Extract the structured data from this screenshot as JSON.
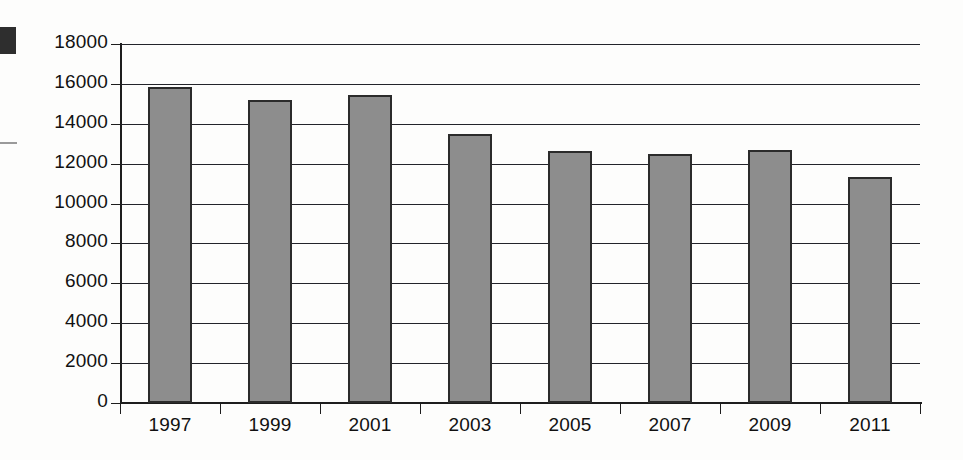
{
  "chart_data": {
    "type": "bar",
    "title": "",
    "subtitle": "",
    "xlabel": "",
    "ylabel": "",
    "categories": [
      "1997",
      "1999",
      "2001",
      "2003",
      "2005",
      "2007",
      "2009",
      "2011"
    ],
    "values": [
      15850,
      15200,
      15450,
      13500,
      12650,
      12500,
      12700,
      11350
    ],
    "ylim": [
      0,
      18000
    ],
    "ytick_labels": [
      "0",
      "2000",
      "4000",
      "6000",
      "8000",
      "10000",
      "12000",
      "14000",
      "16000",
      "18000"
    ],
    "ytick_values": [
      0,
      2000,
      4000,
      6000,
      8000,
      10000,
      12000,
      14000,
      16000,
      18000
    ],
    "grid": true,
    "legend": null,
    "legend_position": "none",
    "bar_fill_color": "#8d8d8d",
    "bar_border_color": "#2b2b2b",
    "axis_color": "#1d1d1d",
    "grid_color": "#23242a",
    "background_color": "#fdfdfc"
  },
  "artifacts": {
    "scan_block_label": "scan-mark-block",
    "scan_rule_label": "scan-mark-rule"
  }
}
